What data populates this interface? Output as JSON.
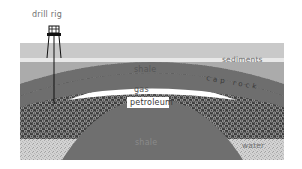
{
  "diagram": {
    "type": "geological-cross-section",
    "labels": {
      "drill_rig": "drill rig",
      "sediments": "sediments",
      "shale_upper": "shale",
      "cap_rock": "cap rock",
      "gas": "gas",
      "petroleum": "petroleum",
      "shale_lower": "shale",
      "water": "water"
    },
    "layers": [
      {
        "name": "sediments",
        "color": "#c9c9c9"
      },
      {
        "name": "shale",
        "color": "#a9a9a9"
      },
      {
        "name": "cap rock",
        "color": "#6e6e6e"
      },
      {
        "name": "gas",
        "color": "#ffffff"
      },
      {
        "name": "petroleum",
        "color": "#5a5a5a",
        "pattern": "hexagonal"
      },
      {
        "name": "shale",
        "color": "#6f6f6f"
      },
      {
        "name": "water",
        "color": "#cfcfcf",
        "pattern": "speckled"
      }
    ]
  }
}
